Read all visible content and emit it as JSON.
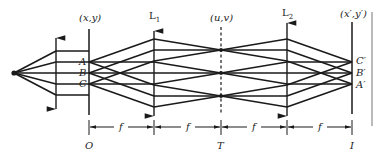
{
  "planes": {
    "object_plane": {
      "top_label": "(x,y)",
      "bottom_label": "O"
    },
    "lens1": {
      "label": "L",
      "sub": "1"
    },
    "transform_plane": {
      "top_label": "(u,v)",
      "bottom_label": "T"
    },
    "lens2": {
      "label": "L",
      "sub": "2"
    },
    "image_plane": {
      "top_label": "(x′,y′)",
      "bottom_label": "I"
    }
  },
  "object_points": [
    "A",
    "B",
    "C"
  ],
  "image_points": [
    "C′",
    "B′",
    "A′"
  ],
  "distances": {
    "seg1": "f",
    "seg2": "f",
    "seg3": "f",
    "seg4": "f"
  },
  "colors": {
    "stroke": "#1a1a1a",
    "background": "#ffffff"
  }
}
